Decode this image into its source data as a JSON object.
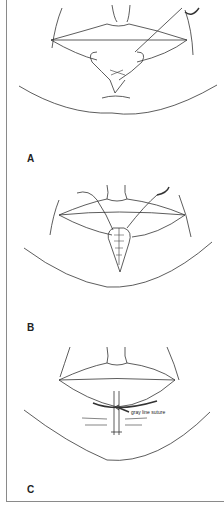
{
  "figure": {
    "panels": [
      {
        "id": "A",
        "label": "A"
      },
      {
        "id": "B",
        "label": "B"
      },
      {
        "id": "C",
        "label": "C",
        "annotation": "gray line suture"
      }
    ],
    "colors": {
      "line": "#333333",
      "border": "#8a8a8a",
      "background": "#ffffff"
    }
  }
}
